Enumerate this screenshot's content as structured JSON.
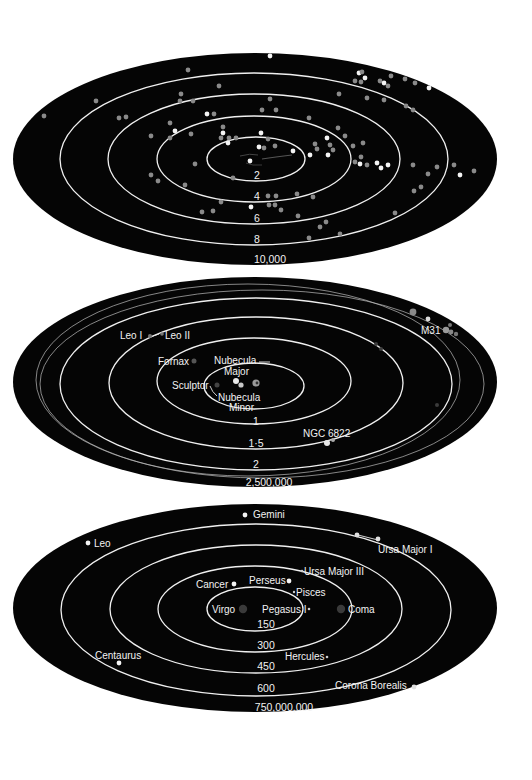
{
  "colors": {
    "background": "#ffffff",
    "space": "#050505",
    "ring": "#f0f0f0",
    "label": "#f2f2f2",
    "dot_bright": "#f4f4f4",
    "dot_mid": "#8a8a8a",
    "dot_dim": "#4a4a4a"
  },
  "diagrams": [
    {
      "id": "star-neighbourhood",
      "ring_labels": [
        "2",
        "4",
        "6",
        "8"
      ],
      "outer_label": "10,000"
    },
    {
      "id": "local-group",
      "ring_labels": [
        "1",
        "1·5",
        "2"
      ],
      "outer_label": "2,500,000",
      "objects": {
        "leo_i": "Leo I",
        "leo_ii": "Leo II",
        "fornax": "Fornax",
        "nubecula_major_1": "Nubecula",
        "nubecula_major_2": "Major",
        "sculptor": "Sculptor",
        "nubecula_minor_1": "Nubecula",
        "nubecula_minor_2": "Minor",
        "ngc6822": "NGC 6822",
        "m31": "M31"
      }
    },
    {
      "id": "galaxy-clusters",
      "ring_labels": [
        "150",
        "300",
        "450",
        "600"
      ],
      "outer_label": "750,000,000",
      "objects": {
        "gemini": "Gemini",
        "leo": "Leo",
        "ursa_major_i": "Ursa Major I",
        "ursa_major_iii": "Ursa Major III",
        "cancer": "Cancer",
        "perseus": "Perseus",
        "pisces": "Pisces",
        "virgo": "Virgo",
        "pegasus_i": "Pegasus I",
        "coma": "Coma",
        "hercules": "Hercules",
        "centaurus": "Centaurus",
        "corona_borealis": "Corona Borealis"
      }
    }
  ]
}
